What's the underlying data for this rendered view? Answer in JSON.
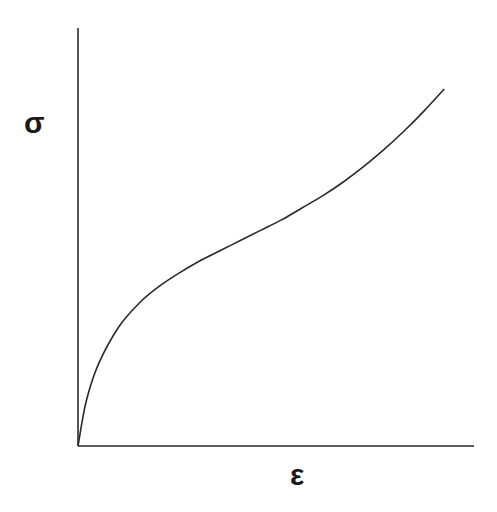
{
  "chart_data": {
    "type": "line",
    "title": "",
    "xlabel": "ε",
    "ylabel": "σ",
    "grid": false,
    "legend": null,
    "ticks": {
      "x": [],
      "y": []
    },
    "xlim": [
      0,
      1
    ],
    "ylim": [
      0,
      1
    ],
    "series": [
      {
        "name": "stress-strain curve",
        "color": "#2a2a2a",
        "x": [
          0.0,
          0.02,
          0.05,
          0.1,
          0.15,
          0.2,
          0.25,
          0.3,
          0.35,
          0.4,
          0.45,
          0.5,
          0.55,
          0.6,
          0.65,
          0.7,
          0.75,
          0.8,
          0.85,
          0.9
        ],
        "y": [
          0.0,
          0.13,
          0.24,
          0.35,
          0.42,
          0.47,
          0.51,
          0.545,
          0.575,
          0.605,
          0.635,
          0.665,
          0.7,
          0.735,
          0.775,
          0.82,
          0.87,
          0.925,
          0.985,
          1.05
        ]
      }
    ]
  },
  "colors": {
    "axis": "#2a2a2a",
    "curve": "#2a2a2a",
    "background": "#ffffff"
  }
}
